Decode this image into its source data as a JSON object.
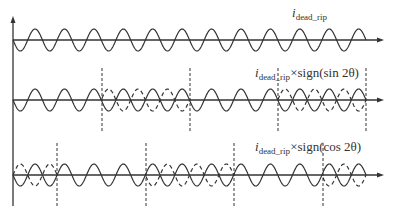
{
  "diagram": {
    "type": "waveform-diagram",
    "colors": {
      "line": "#333333",
      "background": "#ffffff"
    },
    "x_start": 13,
    "x_end": 366,
    "arrow_x": 384,
    "period_px": 29.42,
    "amplitude_px": 11,
    "rows": [
      {
        "id": "row1",
        "axis_y": 40,
        "label": {
          "var": "i",
          "sub": "dead_rip",
          "suffix": ""
        },
        "label_pos": [
          292,
          6
        ],
        "dashed_markers": [],
        "inverted_segments": []
      },
      {
        "id": "row2",
        "axis_y": 100,
        "label": {
          "var": "i",
          "sub": "dead_rip",
          "suffix": "×sign(sin 2θ)"
        },
        "label_pos": [
          255,
          66
        ],
        "dashed_markers": [
          102,
          190,
          278,
          366
        ],
        "inverted_segments": [
          [
            102,
            190
          ],
          [
            278,
            366
          ]
        ]
      },
      {
        "id": "row3",
        "axis_y": 175,
        "label": {
          "var": "i",
          "sub": "dead_rip",
          "suffix": "×sign(cos 2θ)"
        },
        "label_pos": [
          255,
          140
        ],
        "dashed_markers": [
          57,
          146,
          234,
          323
        ],
        "inverted_segments": [
          [
            13,
            57
          ],
          [
            146,
            234
          ],
          [
            323,
            366
          ]
        ]
      }
    ]
  }
}
